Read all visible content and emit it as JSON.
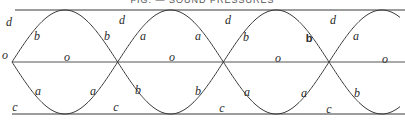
{
  "figure": {
    "header_text": "FIG. — SOUND PRESSURES",
    "lines": {
      "top": {
        "label": "d",
        "y": 10
      },
      "middle": {
        "label": "o",
        "y": 62
      },
      "bottom": {
        "label": "c",
        "y": 114
      }
    },
    "crossings_x": [
      12,
      117,
      222,
      329
    ],
    "colors": {
      "stroke": "#3a3a3a",
      "text": "#2a2a2a"
    },
    "labels": [
      {
        "text": "d",
        "x": 9,
        "y": 22
      },
      {
        "text": "d",
        "x": 122,
        "y": 20
      },
      {
        "text": "d",
        "x": 228,
        "y": 20
      },
      {
        "text": "d",
        "x": 333,
        "y": 20
      },
      {
        "text": "b",
        "x": 37,
        "y": 36
      },
      {
        "text": "b",
        "x": 107,
        "y": 36
      },
      {
        "text": "a",
        "x": 143,
        "y": 36
      },
      {
        "text": "a",
        "x": 198,
        "y": 36
      },
      {
        "text": "b",
        "x": 246,
        "y": 37
      },
      {
        "text": "b",
        "x": 309,
        "y": 38,
        "bold": true
      },
      {
        "text": "a",
        "x": 356,
        "y": 36
      },
      {
        "text": "o",
        "x": 5,
        "y": 55
      },
      {
        "text": "o",
        "x": 67,
        "y": 57
      },
      {
        "text": "o",
        "x": 172,
        "y": 57
      },
      {
        "text": "o",
        "x": 278,
        "y": 58
      },
      {
        "text": "o",
        "x": 385,
        "y": 59
      },
      {
        "text": "a",
        "x": 38,
        "y": 91
      },
      {
        "text": "a",
        "x": 93,
        "y": 91
      },
      {
        "text": "b",
        "x": 138,
        "y": 90
      },
      {
        "text": "b",
        "x": 198,
        "y": 91
      },
      {
        "text": "a",
        "x": 247,
        "y": 92
      },
      {
        "text": "a",
        "x": 304,
        "y": 93
      },
      {
        "text": "b",
        "x": 357,
        "y": 93
      },
      {
        "text": "c",
        "x": 15,
        "y": 107
      },
      {
        "text": "c",
        "x": 116,
        "y": 107
      },
      {
        "text": "c",
        "x": 222,
        "y": 108
      },
      {
        "text": "c",
        "x": 329,
        "y": 109
      }
    ]
  }
}
